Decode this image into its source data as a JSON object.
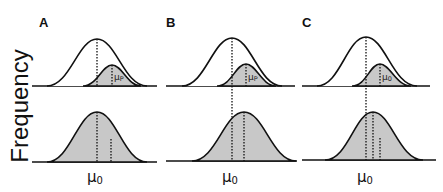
{
  "figure": {
    "y_axis_label": "Frequency",
    "mu0_symbol": "μ",
    "mu0_subscript": "0",
    "colors": {
      "line": "#111111",
      "shaded": "#c8c8c8",
      "background": "#ffffff"
    }
  },
  "panels": [
    {
      "label": "A",
      "top_small_label": "μ",
      "top_small_sub": "P",
      "x_label": "μ",
      "x_sub": "0"
    },
    {
      "label": "B",
      "top_small_label": "μ",
      "top_small_sub": "P",
      "x_label": "μ",
      "x_sub": "0"
    },
    {
      "label": "C",
      "top_small_label": "μ",
      "top_small_sub": "0",
      "x_label": "μ",
      "x_sub": "0"
    }
  ]
}
